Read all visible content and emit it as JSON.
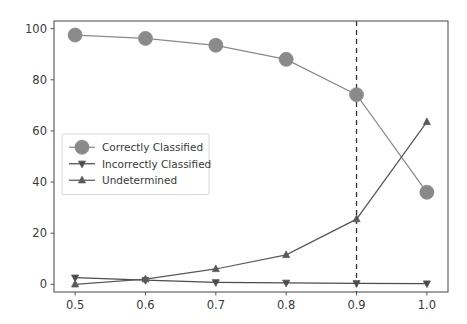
{
  "chart_data": {
    "type": "line",
    "title": "",
    "xlabel": "",
    "ylabel": "",
    "x": [
      0.5,
      0.6,
      0.7,
      0.8,
      0.9,
      1.0
    ],
    "xlim": [
      0.47,
      1.03
    ],
    "ylim": [
      -3,
      103
    ],
    "xticks": [
      "0.5",
      "0.6",
      "0.7",
      "0.8",
      "0.9",
      "1.0"
    ],
    "xtick_values": [
      0.5,
      0.6,
      0.7,
      0.8,
      0.9,
      1.0
    ],
    "yticks": [
      "0",
      "20",
      "40",
      "60",
      "80",
      "100"
    ],
    "ytick_values": [
      0,
      20,
      40,
      60,
      80,
      100
    ],
    "grid": false,
    "legend_position": "center-left",
    "series": [
      {
        "name": "Correctly Classified",
        "values": [
          97.5,
          96.2,
          93.5,
          88.0,
          74.2,
          36.0
        ],
        "color": "#8a8a8a",
        "marker": "circle",
        "marker_size": 7
      },
      {
        "name": "Incorrectly Classified",
        "values": [
          2.6,
          1.6,
          0.8,
          0.6,
          0.4,
          0.3
        ],
        "color": "#4d4d4d",
        "marker": "triangle-down",
        "marker_size": 3.5
      },
      {
        "name": "Undetermined",
        "values": [
          0.0,
          2.0,
          6.0,
          11.5,
          25.5,
          63.5
        ],
        "color": "#5a5a5a",
        "marker": "triangle-up",
        "marker_size": 3.5
      }
    ],
    "annotations": [
      {
        "type": "vertical-line",
        "x": 0.9,
        "style": "dashed",
        "color": "#303030"
      }
    ]
  },
  "figure": {
    "background_color": "#ffffff",
    "axes_background_color": "#ffffff",
    "spine_color": "#555555",
    "tick_label_color": "#3a3a3a"
  }
}
